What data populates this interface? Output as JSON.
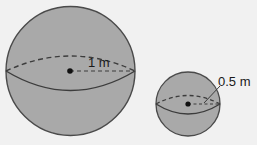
{
  "figure": {
    "colors": {
      "background": "#f1f1f1",
      "sphere_fill": "#a9a9a9",
      "stroke": "#3c3c3c"
    },
    "large_sphere": {
      "radius_label": "1 m"
    },
    "small_sphere": {
      "radius_label": "0.5 m"
    }
  }
}
